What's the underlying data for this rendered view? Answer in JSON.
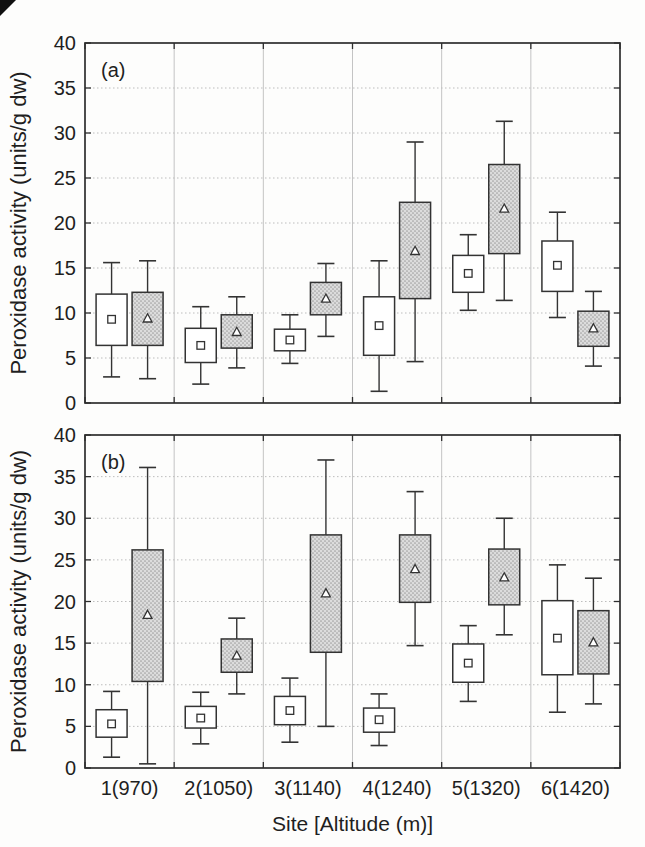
{
  "figure": {
    "ylabel": "Peroxidase activity (units/g dw)",
    "xlabel": "Site [Altitude (m)]",
    "panel_a_label": "(a)",
    "panel_b_label": "(b)"
  },
  "colors": {
    "axis": "#2e2e2e",
    "line": "#333333",
    "text": "#1f1f1f",
    "grid": "#bdbdbd",
    "box_open_fill": "#ffffff",
    "shaded_base": "#dcdcdc",
    "shaded_dot": "#a2a2a2",
    "artifact": "#101010",
    "background": "#fdfdfc"
  },
  "chart_data": [
    {
      "type": "box",
      "panel": "(a)",
      "ylabel": "Peroxidase activity (units/g dw)",
      "xlabel": "",
      "ylim": [
        0,
        40
      ],
      "yticks": [
        0,
        5,
        10,
        15,
        20,
        25,
        30,
        35,
        40
      ],
      "grid": true,
      "legend": "none",
      "categories": [
        "1(970)",
        "2(1050)",
        "3(1140)",
        "4(1240)",
        "5(1320)",
        "6(1420)"
      ],
      "series": [
        {
          "name": "open-box-square-marker",
          "marker": "square",
          "fill": "white",
          "boxes": [
            {
              "low": 2.9,
              "q1": 6.4,
              "mid": 9.3,
              "q3": 12.1,
              "high": 15.6
            },
            {
              "low": 2.1,
              "q1": 4.5,
              "mid": 6.4,
              "q3": 8.3,
              "high": 10.7
            },
            {
              "low": 4.4,
              "q1": 5.8,
              "mid": 7.0,
              "q3": 8.2,
              "high": 9.8
            },
            {
              "low": 1.3,
              "q1": 5.3,
              "mid": 8.6,
              "q3": 11.8,
              "high": 15.8
            },
            {
              "low": 10.3,
              "q1": 12.3,
              "mid": 14.4,
              "q3": 16.4,
              "high": 18.7
            },
            {
              "low": 9.5,
              "q1": 12.4,
              "mid": 15.3,
              "q3": 18.0,
              "high": 21.2
            }
          ]
        },
        {
          "name": "shaded-box-triangle-marker",
          "marker": "triangle",
          "fill": "stipple-gray",
          "boxes": [
            {
              "low": 2.7,
              "q1": 6.4,
              "mid": 9.4,
              "q3": 12.3,
              "high": 15.8
            },
            {
              "low": 3.9,
              "q1": 6.1,
              "mid": 7.9,
              "q3": 9.8,
              "high": 11.8
            },
            {
              "low": 7.4,
              "q1": 9.8,
              "mid": 11.6,
              "q3": 13.4,
              "high": 15.5
            },
            {
              "low": 4.6,
              "q1": 11.6,
              "mid": 16.9,
              "q3": 22.3,
              "high": 29.0
            },
            {
              "low": 11.4,
              "q1": 16.6,
              "mid": 21.6,
              "q3": 26.5,
              "high": 31.3
            },
            {
              "low": 4.1,
              "q1": 6.3,
              "mid": 8.3,
              "q3": 10.2,
              "high": 12.4
            }
          ]
        }
      ]
    },
    {
      "type": "box",
      "panel": "(b)",
      "ylabel": "Peroxidase activity (units/g dw)",
      "xlabel": "Site [Altitude (m)]",
      "ylim": [
        0,
        40
      ],
      "yticks": [
        0,
        5,
        10,
        15,
        20,
        25,
        30,
        35,
        40
      ],
      "grid": true,
      "legend": "none",
      "categories": [
        "1(970)",
        "2(1050)",
        "3(1140)",
        "4(1240)",
        "5(1320)",
        "6(1420)"
      ],
      "series": [
        {
          "name": "open-box-square-marker",
          "marker": "square",
          "fill": "white",
          "boxes": [
            {
              "low": 1.3,
              "q1": 3.7,
              "mid": 5.3,
              "q3": 7.0,
              "high": 9.2
            },
            {
              "low": 2.9,
              "q1": 4.8,
              "mid": 6.0,
              "q3": 7.4,
              "high": 9.1
            },
            {
              "low": 3.1,
              "q1": 5.2,
              "mid": 6.9,
              "q3": 8.6,
              "high": 10.8
            },
            {
              "low": 2.7,
              "q1": 4.3,
              "mid": 5.8,
              "q3": 7.2,
              "high": 8.9
            },
            {
              "low": 8.0,
              "q1": 10.3,
              "mid": 12.6,
              "q3": 14.9,
              "high": 17.1
            },
            {
              "low": 6.7,
              "q1": 11.2,
              "mid": 15.6,
              "q3": 20.1,
              "high": 24.4
            }
          ]
        },
        {
          "name": "shaded-box-triangle-marker",
          "marker": "triangle",
          "fill": "stipple-gray",
          "boxes": [
            {
              "low": 0.5,
              "q1": 10.4,
              "mid": 18.4,
              "q3": 26.2,
              "high": 36.1
            },
            {
              "low": 8.9,
              "q1": 11.5,
              "mid": 13.5,
              "q3": 15.5,
              "high": 18.0
            },
            {
              "low": 5.0,
              "q1": 13.9,
              "mid": 21.0,
              "q3": 28.0,
              "high": 37.0
            },
            {
              "low": 14.7,
              "q1": 19.9,
              "mid": 23.9,
              "q3": 28.0,
              "high": 33.2
            },
            {
              "low": 16.0,
              "q1": 19.6,
              "mid": 22.9,
              "q3": 26.3,
              "high": 30.0
            },
            {
              "low": 7.7,
              "q1": 11.3,
              "mid": 15.1,
              "q3": 18.9,
              "high": 22.8
            }
          ]
        }
      ]
    }
  ]
}
